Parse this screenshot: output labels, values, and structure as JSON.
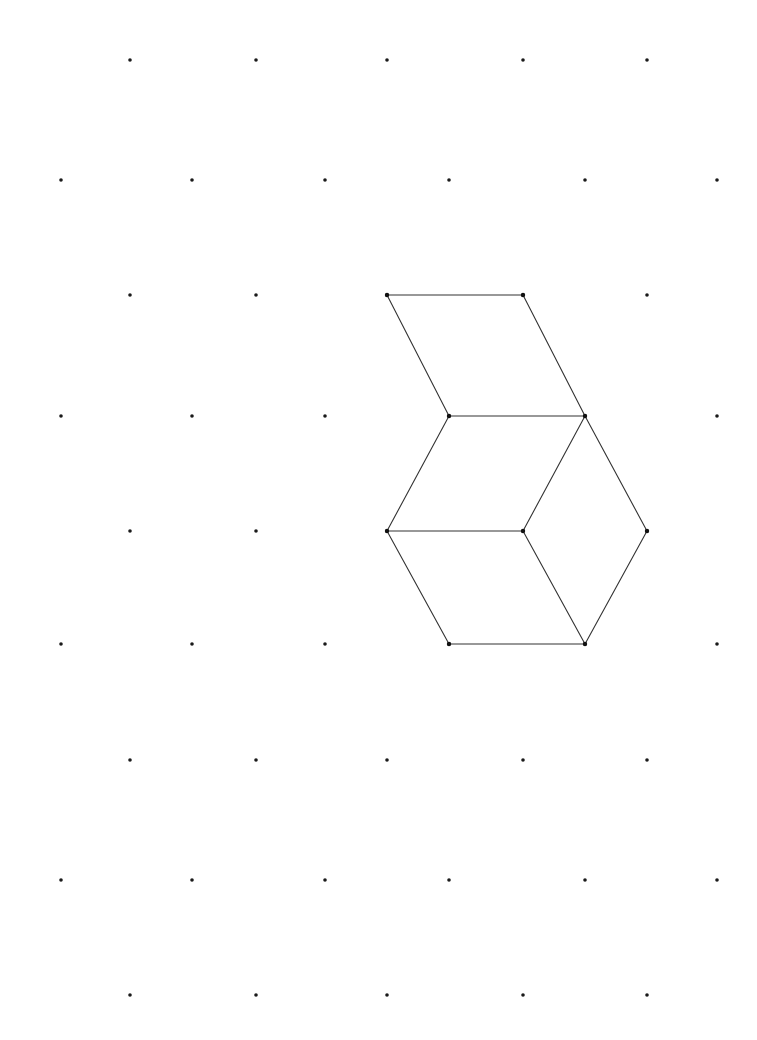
{
  "diagram": {
    "type": "isometric-dot-grid-drawing",
    "colors": {
      "background": "#ffffff",
      "dot": "#1a1a1a",
      "line": "#333333"
    },
    "grid": {
      "rows": [
        {
          "row": 0,
          "offset": true,
          "cols": [
            0,
            1,
            2,
            3,
            4
          ]
        },
        {
          "row": 1,
          "offset": false,
          "cols": [
            0,
            1,
            2,
            3,
            4,
            5
          ]
        },
        {
          "row": 2,
          "offset": true,
          "cols": [
            0,
            1,
            2,
            3,
            4
          ]
        },
        {
          "row": 3,
          "offset": false,
          "cols": [
            0,
            1,
            2,
            3,
            4,
            5
          ]
        },
        {
          "row": 4,
          "offset": true,
          "cols": [
            0,
            1,
            2,
            3,
            4
          ]
        },
        {
          "row": 5,
          "offset": false,
          "cols": [
            0,
            1,
            2,
            3,
            4,
            5
          ]
        },
        {
          "row": 6,
          "offset": true,
          "cols": [
            0,
            1,
            2,
            3,
            4
          ]
        },
        {
          "row": 7,
          "offset": false,
          "cols": [
            0,
            1,
            2,
            3,
            4,
            5
          ]
        },
        {
          "row": 8,
          "offset": true,
          "cols": [
            0,
            1,
            2,
            3,
            4
          ]
        }
      ]
    },
    "vertices": {
      "A": [
        2,
        2
      ],
      "B": [
        3,
        2
      ],
      "C": [
        3,
        3
      ],
      "D": [
        4,
        3
      ],
      "E": [
        2,
        4
      ],
      "F": [
        3,
        4
      ],
      "G": [
        4,
        4
      ],
      "H": [
        3,
        5
      ],
      "I": [
        4,
        5
      ]
    },
    "edges": [
      [
        "A",
        "B"
      ],
      [
        "A",
        "C"
      ],
      [
        "B",
        "D"
      ],
      [
        "C",
        "D"
      ],
      [
        "C",
        "E"
      ],
      [
        "D",
        "F"
      ],
      [
        "E",
        "F"
      ],
      [
        "D",
        "G"
      ],
      [
        "F",
        "I"
      ],
      [
        "G",
        "I"
      ],
      [
        "E",
        "H"
      ],
      [
        "H",
        "I"
      ]
    ],
    "faces": [
      {
        "name": "top-rhombus",
        "vertices": [
          "A",
          "B",
          "D",
          "C"
        ]
      },
      {
        "name": "middle-rhombus",
        "vertices": [
          "C",
          "D",
          "F",
          "E"
        ]
      },
      {
        "name": "right-rhombus",
        "vertices": [
          "D",
          "G",
          "I",
          "F"
        ]
      },
      {
        "name": "bottom-rhombus",
        "vertices": [
          "E",
          "F",
          "I",
          "H"
        ]
      }
    ]
  }
}
